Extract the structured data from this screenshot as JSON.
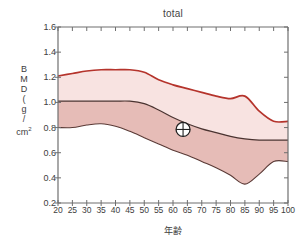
{
  "chart_data": {
    "type": "area",
    "title": "total",
    "xlabel": "年齢",
    "ylabel_lines": [
      "B",
      "M",
      "D",
      "(",
      "g",
      "/",
      "cm2"
    ],
    "ylabel": "BMD (g/cm2)",
    "xlim": [
      20,
      100
    ],
    "ylim": [
      0.2,
      1.6
    ],
    "xticks": [
      20,
      25,
      30,
      35,
      40,
      45,
      50,
      55,
      60,
      65,
      70,
      75,
      80,
      85,
      90,
      95,
      100
    ],
    "yticks": [
      0.2,
      0.4,
      0.6,
      0.8,
      1.0,
      1.2,
      1.4,
      1.6
    ],
    "xtick_labels": [
      "20",
      "25",
      "30",
      "35",
      "40",
      "45",
      "50",
      "55",
      "60",
      "65",
      "70",
      "75",
      "80",
      "85",
      "90",
      "95",
      "100"
    ],
    "ytick_labels": [
      "0.2",
      "0.4",
      "0.6",
      "0.8",
      "1.0",
      "1.2",
      "1.4",
      "1.6"
    ],
    "grid": false,
    "legend": "none",
    "x": [
      20,
      25,
      30,
      35,
      40,
      45,
      50,
      55,
      60,
      65,
      70,
      75,
      80,
      85,
      90,
      95,
      100
    ],
    "series": [
      {
        "name": "upper-reference-line",
        "color": "#b5342c",
        "values": [
          1.21,
          1.23,
          1.25,
          1.26,
          1.26,
          1.26,
          1.24,
          1.18,
          1.14,
          1.11,
          1.08,
          1.05,
          1.03,
          1.05,
          0.93,
          0.85,
          0.85
        ]
      },
      {
        "name": "mean-line",
        "color": "#4a3330",
        "values": [
          1.01,
          1.01,
          1.01,
          1.01,
          1.01,
          1.01,
          0.99,
          0.94,
          0.88,
          0.83,
          0.79,
          0.76,
          0.73,
          0.71,
          0.7,
          0.7,
          0.7
        ]
      },
      {
        "name": "lower-reference-line",
        "color": "#5a3a36",
        "values": [
          0.8,
          0.8,
          0.82,
          0.83,
          0.81,
          0.77,
          0.72,
          0.67,
          0.62,
          0.58,
          0.53,
          0.48,
          0.42,
          0.35,
          0.43,
          0.53,
          0.53
        ]
      }
    ],
    "bands": [
      {
        "name": "upper-band",
        "between": [
          "mean-line",
          "upper-reference-line"
        ],
        "fill": "#f8e3e1"
      },
      {
        "name": "lower-band",
        "between": [
          "lower-reference-line",
          "mean-line"
        ],
        "fill": "#e6bcb7"
      }
    ],
    "annotations": [
      {
        "name": "patient-marker",
        "symbol": "circle-crosshair",
        "x": 63.5,
        "y": 0.785,
        "label": ""
      }
    ],
    "colors": {
      "upper_line": "#b5342c",
      "mean_line": "#4a3330",
      "lower_line": "#5a3a36",
      "upper_band": "#f8e3e1",
      "lower_band": "#e6bcb7",
      "axis": "#6f6f6f",
      "text": "#3d3d3d",
      "background": "#ffffff"
    }
  }
}
